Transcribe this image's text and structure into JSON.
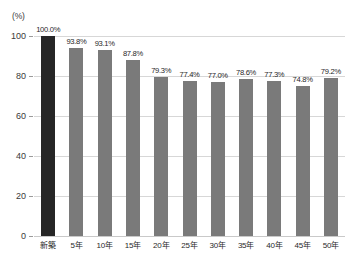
{
  "chart_data": {
    "type": "bar",
    "title": "",
    "subtitle": "",
    "xlabel": "",
    "ylabel": "",
    "unit_label": "(%)",
    "ylim": [
      0,
      100
    ],
    "yticks": [
      0,
      20,
      40,
      60,
      80,
      100
    ],
    "ytick_labels": [
      "0",
      "20",
      "40",
      "60",
      "80",
      "100"
    ],
    "grid": true,
    "grid_orientation": "horizontal",
    "legend": "none",
    "categories": [
      "新築",
      "5年",
      "10年",
      "15年",
      "20年",
      "25年",
      "30年",
      "35年",
      "40年",
      "45年",
      "50年"
    ],
    "values": [
      100.0,
      93.8,
      93.1,
      87.8,
      79.3,
      77.4,
      77.0,
      78.6,
      77.3,
      74.8,
      79.2
    ],
    "data_labels": [
      "100.0%",
      "93.8%",
      "93.1%",
      "87.8%",
      "79.3%",
      "77.4%",
      "77.0%",
      "78.6%",
      "77.3%",
      "74.8%",
      "79.2%"
    ],
    "bar_colors": [
      "#262626",
      "#7a7a7a",
      "#7a7a7a",
      "#7a7a7a",
      "#7a7a7a",
      "#7a7a7a",
      "#7a7a7a",
      "#7a7a7a",
      "#7a7a7a",
      "#7a7a7a",
      "#7a7a7a"
    ],
    "highlight_index": 0,
    "colors": {
      "background": "#ffffff",
      "bar_default": "#7a7a7a",
      "bar_highlight": "#262626",
      "gridline": "#d7d7d7",
      "axis_text": "#3a3a3a"
    }
  }
}
